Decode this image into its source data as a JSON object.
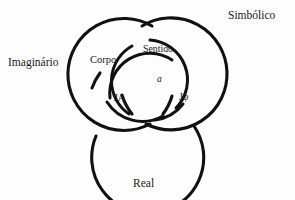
{
  "diagram": {
    "background_color": "#fdfdfd",
    "stroke_color": "#111111",
    "outer_labels": {
      "imaginario": "Imaginário",
      "simbolico": "Simbólico",
      "real": "Real"
    },
    "inner_labels": {
      "corpo": "Corpo",
      "sentido": "Sentido",
      "ja": "JA",
      "jphi": "Jφ",
      "a": "a"
    },
    "rings": [
      {
        "name": "imaginary-ring",
        "cx": 118,
        "cy": 78,
        "r": 56
      },
      {
        "name": "symbolic-ring",
        "cx": 176,
        "cy": 78,
        "r": 56
      },
      {
        "name": "real-ring",
        "cx": 147,
        "cy": 115,
        "r": 56
      }
    ],
    "inner_arcs": [
      {
        "name": "inner-arc-top"
      },
      {
        "name": "inner-arc-left"
      },
      {
        "name": "inner-arc-right"
      }
    ]
  }
}
